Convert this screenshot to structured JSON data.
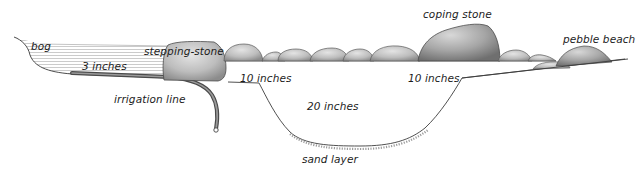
{
  "diagram": {
    "type": "cross-section",
    "labels": {
      "bog": "bog",
      "three_inches": "3 inches",
      "stepping_stone": "stepping-stone",
      "irrigation_line": "irrigation line",
      "ten_inches_left": "10 inches",
      "twenty_inches": "20 inches",
      "sand_layer": "sand layer",
      "coping_stone": "coping stone",
      "ten_inches_right": "10 inches",
      "pebble_beach": "pebble beach"
    },
    "colors": {
      "ink": "#1c1c1c",
      "stone_fill": "#c9c9c9",
      "stone_shade": "#8a8a8a",
      "bog_hatch": "#9a9a9a",
      "pipe": "#555555",
      "background": "#ffffff"
    }
  }
}
